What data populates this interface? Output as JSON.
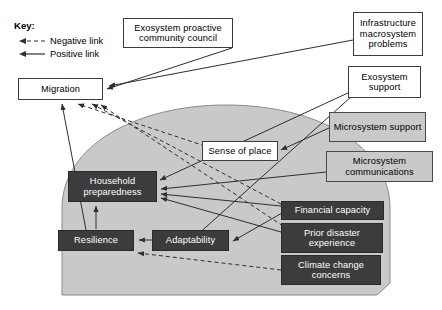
{
  "figure": {
    "type": "influence-diagram",
    "key": {
      "title": "Key:",
      "items": [
        {
          "label": "Negative link",
          "style": "dashed",
          "icon": "dashed-arrow-icon"
        },
        {
          "label": "Positive link",
          "style": "solid",
          "icon": "solid-arrow-icon"
        }
      ]
    },
    "colors": {
      "white_node_fill": "#ffffff",
      "gray_node_fill": "#c9c9c9",
      "dark_node_fill": "#3c3c3c",
      "dark_node_text": "#ffffff",
      "region_fill": "#c9c9c9",
      "stroke": "#3d3d3d"
    },
    "region": {
      "name": "household-system-region",
      "shape": "dome"
    },
    "nodes": [
      {
        "id": "exosystem_council",
        "label": "Exosystem proactive community council",
        "style": "white",
        "x": 123,
        "y": 18,
        "w": 110,
        "h": 30
      },
      {
        "id": "infrastructure",
        "label": "Infrastructure macrosystem problems",
        "style": "white",
        "x": 353,
        "y": 12,
        "w": 70,
        "h": 44
      },
      {
        "id": "exosystem_support",
        "label": "Exosystem support",
        "style": "white",
        "x": 348,
        "y": 66,
        "w": 73,
        "h": 32
      },
      {
        "id": "migration",
        "label": "Migration",
        "style": "white",
        "x": 18,
        "y": 78,
        "w": 85,
        "h": 22
      },
      {
        "id": "microsystem_support",
        "label": "Microsystem support",
        "style": "gray",
        "x": 329,
        "y": 112,
        "w": 97,
        "h": 30
      },
      {
        "id": "microsystem_communications",
        "label": "Microsystem communications",
        "style": "gray",
        "x": 326,
        "y": 151,
        "w": 107,
        "h": 31
      },
      {
        "id": "sense_of_place",
        "label": "Sense of place",
        "style": "white",
        "x": 202,
        "y": 141,
        "w": 76,
        "h": 20
      },
      {
        "id": "household_preparedness",
        "label": "Household preparedness",
        "style": "dark",
        "x": 68,
        "y": 171,
        "w": 89,
        "h": 31
      },
      {
        "id": "financial_capacity",
        "label": "Financial capacity",
        "style": "dark",
        "x": 281,
        "y": 201,
        "w": 103,
        "h": 19
      },
      {
        "id": "prior_disaster_experience",
        "label": "Prior disaster experience",
        "style": "dark",
        "x": 281,
        "y": 223,
        "w": 102,
        "h": 30
      },
      {
        "id": "resilience",
        "label": "Resilience",
        "style": "dark",
        "x": 58,
        "y": 230,
        "w": 76,
        "h": 21
      },
      {
        "id": "adaptability",
        "label": "Adaptability",
        "style": "dark",
        "x": 152,
        "y": 230,
        "w": 77,
        "h": 21
      },
      {
        "id": "climate_change_concerns",
        "label": "Climate change concerns",
        "style": "dark",
        "x": 281,
        "y": 255,
        "w": 100,
        "h": 30
      }
    ],
    "links": [
      {
        "from": "exosystem_council",
        "to": "migration",
        "type": "positive"
      },
      {
        "from": "infrastructure",
        "to": "migration",
        "type": "positive"
      },
      {
        "from": "exosystem_support",
        "to": "household_preparedness",
        "type": "positive"
      },
      {
        "from": "exosystem_support",
        "to": "adaptability",
        "type": "positive"
      },
      {
        "from": "microsystem_support",
        "to": "sense_of_place",
        "type": "positive"
      },
      {
        "from": "microsystem_communications",
        "to": "household_preparedness",
        "type": "positive"
      },
      {
        "from": "financial_capacity",
        "to": "household_preparedness",
        "type": "positive"
      },
      {
        "from": "financial_capacity",
        "to": "migration",
        "type": "negative"
      },
      {
        "from": "prior_disaster_experience",
        "to": "household_preparedness",
        "type": "positive"
      },
      {
        "from": "prior_disaster_experience",
        "to": "migration",
        "type": "negative"
      },
      {
        "from": "climate_change_concerns",
        "to": "resilience",
        "type": "negative"
      },
      {
        "from": "sense_of_place",
        "to": "migration",
        "type": "negative"
      },
      {
        "from": "household_preparedness",
        "to": "resilience",
        "type": "positive"
      },
      {
        "from": "adaptability",
        "to": "resilience",
        "type": "positive"
      },
      {
        "from": "resilience",
        "to": "migration",
        "type": "positive"
      }
    ]
  }
}
